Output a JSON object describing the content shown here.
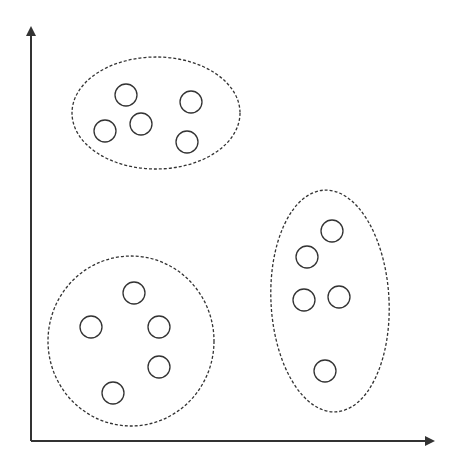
{
  "diagram": {
    "title": "",
    "type": "clustering-scatter",
    "colors": {
      "stroke": "#333333",
      "background": "#ffffff"
    },
    "axes": {
      "origin": [
        31,
        441
      ],
      "y_end": [
        31,
        28
      ],
      "x_end": [
        433,
        441
      ],
      "x_label": "",
      "y_label": ""
    },
    "clusters": [
      {
        "name": "cluster-top",
        "boundary": {
          "cx": 156,
          "cy": 113,
          "rx": 84,
          "ry": 56,
          "rotate": 0
        },
        "points": [
          [
            126,
            95
          ],
          [
            191,
            102
          ],
          [
            141,
            124
          ],
          [
            105,
            131
          ],
          [
            187,
            142
          ]
        ]
      },
      {
        "name": "cluster-bottom-left",
        "boundary": {
          "cx": 131,
          "cy": 341,
          "rx": 83,
          "ry": 85,
          "rotate": 0
        },
        "points": [
          [
            134,
            293
          ],
          [
            91,
            327
          ],
          [
            159,
            327
          ],
          [
            159,
            367
          ],
          [
            113,
            393
          ]
        ]
      },
      {
        "name": "cluster-right",
        "boundary": {
          "cx": 330,
          "cy": 301,
          "rx": 59,
          "ry": 111,
          "rotate": -3
        },
        "points": [
          [
            332,
            231
          ],
          [
            307,
            257
          ],
          [
            304,
            300
          ],
          [
            339,
            297
          ],
          [
            325,
            371
          ]
        ]
      }
    ],
    "point_radius": 11
  }
}
